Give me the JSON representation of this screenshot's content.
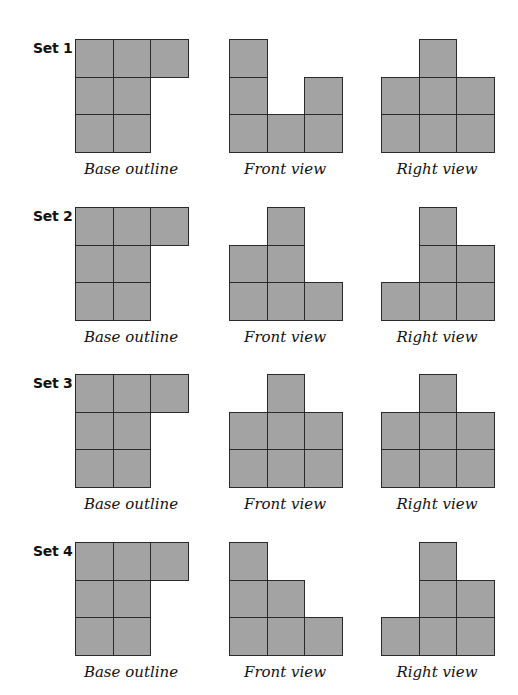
{
  "cell_color": "#a3a3a3",
  "line_color": "#2a2a2a",
  "captions": {
    "base": "Base outline",
    "front": "Front view",
    "right": "Right view"
  },
  "sets": [
    {
      "label": "Set 1",
      "base": [
        [
          1,
          1,
          1
        ],
        [
          1,
          1,
          0
        ],
        [
          1,
          1,
          0
        ]
      ],
      "front_heights": [
        3,
        1,
        2
      ],
      "right_heights": [
        2,
        3,
        2
      ]
    },
    {
      "label": "Set 2",
      "base": [
        [
          1,
          1,
          1
        ],
        [
          1,
          1,
          0
        ],
        [
          1,
          1,
          0
        ]
      ],
      "front_heights": [
        2,
        3,
        1
      ],
      "right_heights": [
        1,
        3,
        2
      ]
    },
    {
      "label": "Set 3",
      "base": [
        [
          1,
          1,
          1
        ],
        [
          1,
          1,
          0
        ],
        [
          1,
          1,
          0
        ]
      ],
      "front_heights": [
        2,
        3,
        2
      ],
      "right_heights": [
        2,
        3,
        2
      ]
    },
    {
      "label": "Set 4",
      "base": [
        [
          1,
          1,
          1
        ],
        [
          1,
          1,
          0
        ],
        [
          1,
          1,
          0
        ]
      ],
      "front_heights": [
        3,
        2,
        1
      ],
      "right_heights": [
        1,
        3,
        2
      ]
    }
  ]
}
